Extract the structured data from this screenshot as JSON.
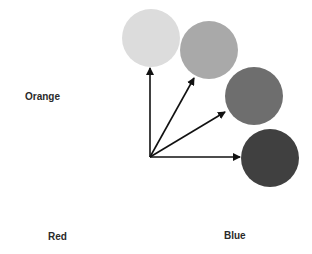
{
  "labels": {
    "orange": "Orange",
    "red": "Red",
    "blue": "Blue"
  },
  "circles": [
    {
      "name": "circle-lightest",
      "cx": 151,
      "cy": 38,
      "r": 29,
      "color": "#dcdcdc"
    },
    {
      "name": "circle-light",
      "cx": 209,
      "cy": 50,
      "r": 29,
      "color": "#a9a9a9"
    },
    {
      "name": "circle-medium",
      "cx": 254,
      "cy": 96,
      "r": 29,
      "color": "#6e6e6e"
    },
    {
      "name": "circle-dark",
      "cx": 270,
      "cy": 158,
      "r": 29,
      "color": "#404040"
    }
  ],
  "arrows": {
    "origin": {
      "x": 150,
      "y": 157
    },
    "color": "#111111",
    "tips": [
      {
        "x": 150,
        "y": 68
      },
      {
        "x": 194,
        "y": 78
      },
      {
        "x": 225,
        "y": 112
      },
      {
        "x": 240,
        "y": 157
      }
    ]
  }
}
